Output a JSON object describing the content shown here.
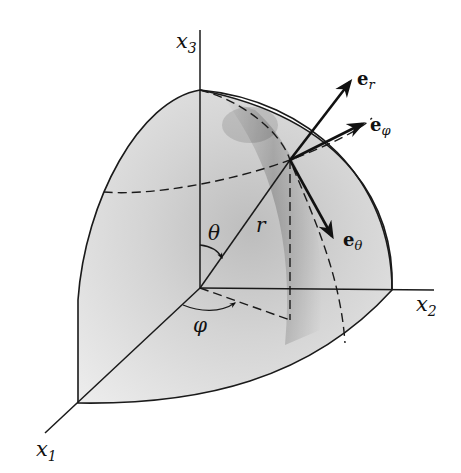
{
  "figure": {
    "axes": {
      "x3": {
        "label": "x",
        "subscript": "3"
      },
      "x2": {
        "label": "x",
        "subscript": "2"
      },
      "x1": {
        "label": "x",
        "subscript": "1"
      }
    },
    "vectors": {
      "e_r": {
        "base": "e",
        "subscript": "r"
      },
      "e_phi": {
        "base": "e",
        "subscript": "φ"
      },
      "e_theta": {
        "base": "e",
        "subscript": "θ"
      }
    },
    "symbols": {
      "radius": "r",
      "polar_angle": "θ",
      "azimuth_angle": "φ"
    },
    "colors": {
      "line": "#1a1a1a",
      "surface_light": "#e8e8e8",
      "surface_dark": "#8a8a8a",
      "background": "#ffffff"
    }
  }
}
